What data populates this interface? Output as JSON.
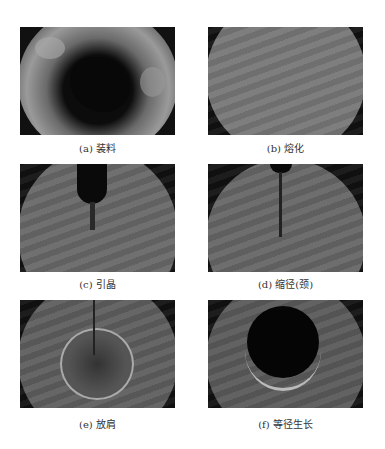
{
  "figure": {
    "panels": [
      {
        "id": "a",
        "caption": "(a) 装料"
      },
      {
        "id": "b",
        "caption": "(b) 熔化"
      },
      {
        "id": "c",
        "caption": "(c) 引晶"
      },
      {
        "id": "d",
        "caption": "(d) 缩径(颈)"
      },
      {
        "id": "e",
        "caption": "(e) 放肩"
      },
      {
        "id": "f",
        "caption": "(f) 等径生长"
      }
    ]
  }
}
